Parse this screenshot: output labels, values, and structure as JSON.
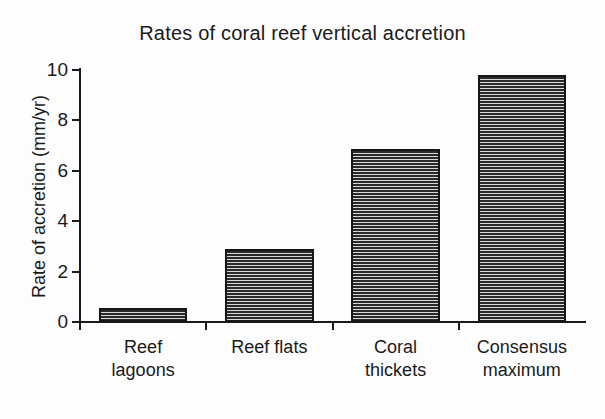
{
  "chart_data": {
    "type": "bar",
    "title": "Rates of coral reef vertical accretion",
    "xlabel": "",
    "ylabel": "Rate of accretion (mm/yr)",
    "categories": [
      "Reef lagoons",
      "Reef flats",
      "Coral thickets",
      "Consensus maximum"
    ],
    "category_lines": [
      [
        "Reef",
        "lagoons"
      ],
      [
        "Reef flats"
      ],
      [
        "Coral",
        "thickets"
      ],
      [
        "Consensus",
        "maximum"
      ]
    ],
    "values": [
      0.55,
      2.9,
      6.85,
      9.8
    ],
    "ylim": [
      0,
      10
    ],
    "yticks": [
      0,
      2,
      4,
      6,
      8,
      10
    ],
    "ytick_labels": [
      "0",
      "2",
      "4",
      "6",
      "8",
      "10"
    ],
    "grid": false,
    "legend": null,
    "bar_fill": "horizontal-line-hatch",
    "bar_color": "#2a2a2a",
    "bar_edge_color": "#161616",
    "background_color": "#fdfdfd",
    "text_color": "#1a1a1a"
  }
}
